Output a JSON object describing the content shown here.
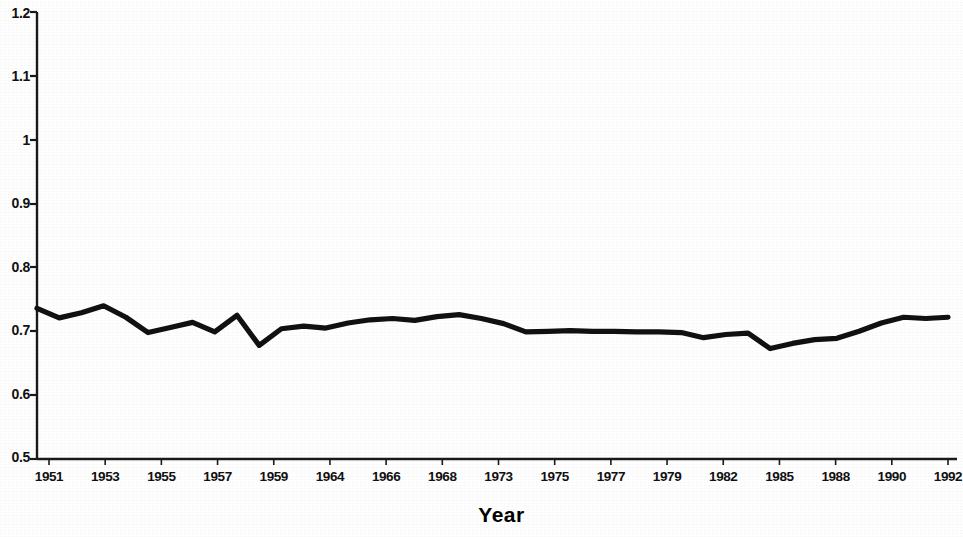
{
  "chart_data": {
    "type": "line",
    "title": "",
    "xlabel": "Year",
    "ylabel": "",
    "grid": false,
    "legend": null,
    "ylim": [
      0.5,
      1.2
    ],
    "ytick_labels": [
      "1.2",
      "1.1",
      "1",
      "0.9",
      "0.8",
      "0.7",
      "0.6",
      "0.5"
    ],
    "ytick_values": [
      1.2,
      1.1,
      1.0,
      0.9,
      0.8,
      0.7,
      0.6,
      0.5
    ],
    "xtick_labels": [
      "1951",
      "1953",
      "1955",
      "1957",
      "1959",
      "1964",
      "1966",
      "1968",
      "1973",
      "1975",
      "1977",
      "1979",
      "1982",
      "1985",
      "1988",
      "1990",
      "1992"
    ],
    "x": [
      1951,
      1952,
      1953,
      1954,
      1955,
      1956,
      1957,
      1958,
      1959,
      1960,
      1961,
      1962,
      1963,
      1964,
      1965,
      1966,
      1967,
      1968,
      1969,
      1970,
      1971,
      1972,
      1973,
      1974,
      1975,
      1976,
      1977,
      1978,
      1979,
      1980,
      1981,
      1982,
      1983,
      1984,
      1985,
      1986,
      1987,
      1988,
      1989,
      1990,
      1991,
      1992
    ],
    "values": [
      0.736,
      0.721,
      0.729,
      0.74,
      0.722,
      0.698,
      0.706,
      0.714,
      0.699,
      0.725,
      0.678,
      0.704,
      0.708,
      0.705,
      0.713,
      0.718,
      0.72,
      0.717,
      0.723,
      0.726,
      0.72,
      0.712,
      0.699,
      0.7,
      0.701,
      0.7,
      0.7,
      0.699,
      0.699,
      0.698,
      0.69,
      0.695,
      0.697,
      0.673,
      0.681,
      0.687,
      0.689,
      0.7,
      0.713,
      0.722,
      0.72,
      0.722
    ],
    "series": [
      {
        "name": "ratio",
        "color": "#111111",
        "values": [
          0.736,
          0.721,
          0.729,
          0.74,
          0.722,
          0.698,
          0.706,
          0.714,
          0.699,
          0.725,
          0.678,
          0.704,
          0.708,
          0.705,
          0.713,
          0.718,
          0.72,
          0.717,
          0.723,
          0.726,
          0.72,
          0.712,
          0.699,
          0.7,
          0.701,
          0.7,
          0.7,
          0.699,
          0.699,
          0.698,
          0.69,
          0.695,
          0.697,
          0.673,
          0.681,
          0.687,
          0.689,
          0.7,
          0.713,
          0.722,
          0.72,
          0.722
        ]
      }
    ]
  },
  "axis": {
    "line_color": "#1a1a1a",
    "x_title": "Year"
  }
}
